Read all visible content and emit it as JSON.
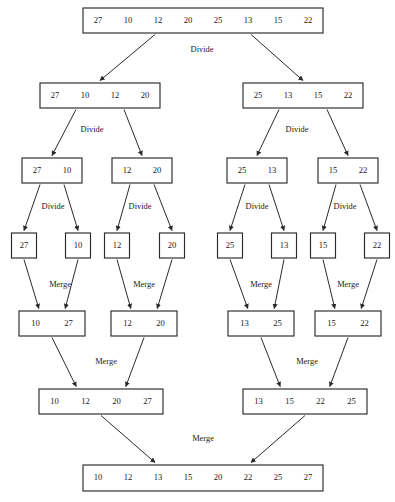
{
  "diagram": {
    "type": "merge-sort-tree",
    "input_array": [
      27,
      10,
      12,
      20,
      25,
      13,
      15,
      22
    ],
    "sorted_array": [
      10,
      12,
      13,
      15,
      20,
      22,
      25,
      27
    ],
    "labels": {
      "divide": "Divide",
      "merge": "Merge"
    },
    "colors": {
      "box_stroke": "#2a2a2a",
      "box_fill": "#ffffff",
      "text": "#202020",
      "background": "#ffffff"
    },
    "levels": [
      {
        "level": 0,
        "phase": "input",
        "nodes": [
          {
            "id": "n0",
            "values": [
              27,
              10,
              12,
              20,
              25,
              13,
              15,
              22
            ]
          }
        ]
      },
      {
        "level": 1,
        "phase": "divide",
        "nodes": [
          {
            "id": "n1a",
            "values": [
              27,
              10,
              12,
              20
            ]
          },
          {
            "id": "n1b",
            "values": [
              25,
              13,
              15,
              22
            ]
          }
        ]
      },
      {
        "level": 2,
        "phase": "divide",
        "nodes": [
          {
            "id": "n2a",
            "values": [
              27,
              10
            ]
          },
          {
            "id": "n2b",
            "values": [
              12,
              20
            ]
          },
          {
            "id": "n2c",
            "values": [
              25,
              13
            ]
          },
          {
            "id": "n2d",
            "values": [
              15,
              22
            ]
          }
        ]
      },
      {
        "level": 3,
        "phase": "divide",
        "nodes": [
          {
            "id": "n3a",
            "values": [
              27
            ]
          },
          {
            "id": "n3b",
            "values": [
              10
            ]
          },
          {
            "id": "n3c",
            "values": [
              12
            ]
          },
          {
            "id": "n3d",
            "values": [
              20
            ]
          },
          {
            "id": "n3e",
            "values": [
              25
            ]
          },
          {
            "id": "n3f",
            "values": [
              13
            ]
          },
          {
            "id": "n3g",
            "values": [
              15
            ]
          },
          {
            "id": "n3h",
            "values": [
              22
            ]
          }
        ]
      },
      {
        "level": 4,
        "phase": "merge",
        "nodes": [
          {
            "id": "n4a",
            "values": [
              10,
              27
            ]
          },
          {
            "id": "n4b",
            "values": [
              12,
              20
            ]
          },
          {
            "id": "n4c",
            "values": [
              13,
              25
            ]
          },
          {
            "id": "n4d",
            "values": [
              15,
              22
            ]
          }
        ]
      },
      {
        "level": 5,
        "phase": "merge",
        "nodes": [
          {
            "id": "n5a",
            "values": [
              10,
              12,
              20,
              27
            ]
          },
          {
            "id": "n5b",
            "values": [
              13,
              15,
              22,
              25
            ]
          }
        ]
      },
      {
        "level": 6,
        "phase": "merge",
        "nodes": [
          {
            "id": "n6",
            "values": [
              10,
              12,
              13,
              15,
              20,
              22,
              25,
              27
            ]
          }
        ]
      }
    ],
    "operation_labels": [
      {
        "id": "op-divide-0",
        "text": "Divide",
        "x": 202,
        "y": 50
      },
      {
        "id": "op-divide-1l",
        "text": "Divide",
        "x": 92,
        "y": 130
      },
      {
        "id": "op-divide-1r",
        "text": "Divide",
        "x": 297,
        "y": 130
      },
      {
        "id": "op-divide-2a",
        "text": "Divide",
        "x": 53,
        "y": 207
      },
      {
        "id": "op-divide-2b",
        "text": "Divide",
        "x": 140,
        "y": 207
      },
      {
        "id": "op-divide-2c",
        "text": "Divide",
        "x": 257,
        "y": 207
      },
      {
        "id": "op-divide-2d",
        "text": "Divide",
        "x": 345,
        "y": 207
      },
      {
        "id": "op-merge-3a",
        "text": "Merge",
        "x": 60,
        "y": 285
      },
      {
        "id": "op-merge-3b",
        "text": "Merge",
        "x": 144,
        "y": 285
      },
      {
        "id": "op-merge-3c",
        "text": "Merge",
        "x": 261,
        "y": 285
      },
      {
        "id": "op-merge-3d",
        "text": "Merge",
        "x": 348,
        "y": 285
      },
      {
        "id": "op-merge-4l",
        "text": "Merge",
        "x": 106,
        "y": 362
      },
      {
        "id": "op-merge-4r",
        "text": "Merge",
        "x": 307,
        "y": 362
      },
      {
        "id": "op-merge-5",
        "text": "Merge",
        "x": 203,
        "y": 439
      }
    ]
  }
}
